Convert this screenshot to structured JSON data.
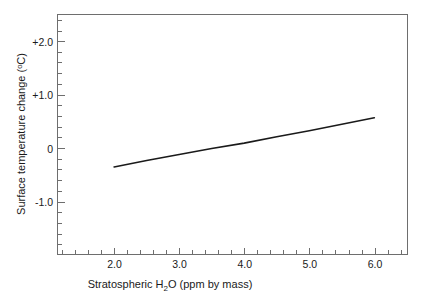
{
  "chart_data": {
    "type": "line",
    "title": "",
    "xlabel": "Stratospheric H₂O (ppm by mass)",
    "ylabel": "Surface temperature change (°C)",
    "xlabel_parts": {
      "pre": "Stratospheric H",
      "sub": "2",
      "post": "O (ppm by mass)"
    },
    "ylabel_parts": {
      "pre": "Surface temperature change (",
      "sup": "o",
      "post": "C)"
    },
    "xlim": [
      1.13,
      6.51
    ],
    "ylim": [
      -1.93,
      2.51
    ],
    "xticks": [
      2.0,
      3.0,
      4.0,
      5.0,
      6.0
    ],
    "xticklabels": [
      "2.0",
      "3.0",
      "4.0",
      "5.0",
      "6.0"
    ],
    "yticks": [
      2.0,
      1.0,
      0.0,
      -1.0
    ],
    "yticklabels": [
      "+2.0",
      "+1.0",
      "0",
      "-1.0"
    ],
    "x_minor_step": 0.2,
    "y_minor_step": 0.2,
    "grid": false,
    "legend": "none",
    "line_color": "#1a1a1a",
    "axis_color": "#6e6e6e",
    "background": "#ffffff",
    "series": [
      {
        "name": "Surface temperature change",
        "x": [
          2.0,
          2.5,
          3.0,
          3.5,
          4.0,
          4.5,
          5.0,
          5.5,
          6.0
        ],
        "y": [
          -0.31,
          -0.19,
          -0.08,
          0.03,
          0.13,
          0.25,
          0.36,
          0.48,
          0.6
        ]
      }
    ]
  }
}
